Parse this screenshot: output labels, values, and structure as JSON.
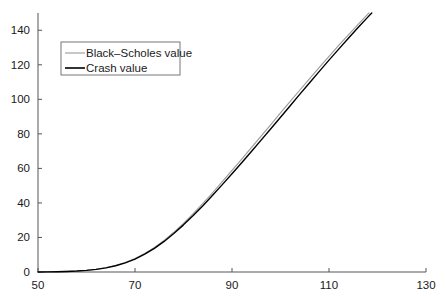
{
  "chart_data": {
    "type": "line",
    "title": "",
    "subtitle": "",
    "xlabel": "",
    "ylabel": "",
    "xlim": [
      50,
      130
    ],
    "ylim": [
      0,
      150
    ],
    "xticks": [
      50,
      70,
      90,
      110,
      130
    ],
    "yticks": [
      0,
      20,
      40,
      60,
      80,
      100,
      120,
      140
    ],
    "xtick_labels": [
      "50",
      "70",
      "90",
      "110",
      "130"
    ],
    "ytick_labels": [
      "0",
      "20",
      "40",
      "60",
      "80",
      "100",
      "120",
      "140"
    ],
    "grid": false,
    "legend_position": "upper left",
    "annotations": [],
    "series": [
      {
        "name": "Black-Scholes value",
        "color": "#9a9a9a",
        "linewidth": 1.1,
        "x": [
          50,
          52,
          54,
          56,
          58,
          60,
          62,
          64,
          66,
          68,
          70,
          72,
          74,
          76,
          78,
          80,
          82,
          84,
          86,
          88,
          90,
          92,
          94,
          96,
          98,
          100,
          102,
          104,
          106,
          108,
          110,
          112,
          114,
          116,
          118,
          120,
          122,
          124,
          126,
          128,
          130
        ],
        "y": [
          0.05,
          0.1,
          0.2,
          0.35,
          0.6,
          1.0,
          1.6,
          2.5,
          3.8,
          5.5,
          7.8,
          10.7,
          14.2,
          18.3,
          23.0,
          28.2,
          33.8,
          39.7,
          45.9,
          52.3,
          58.8,
          65.4,
          72.0,
          78.7,
          85.4,
          92.1,
          98.8,
          105.4,
          112.0,
          118.5,
          124.9,
          131.2,
          137.4,
          143.4,
          149.3,
          155.0,
          160.6,
          166.0,
          171.3,
          176.5,
          181.5
        ]
      },
      {
        "name": "Crash value",
        "color": "#000000",
        "linewidth": 1.4,
        "x": [
          50,
          52,
          54,
          56,
          58,
          60,
          62,
          64,
          66,
          68,
          70,
          72,
          74,
          76,
          78,
          80,
          82,
          84,
          86,
          88,
          90,
          92,
          94,
          96,
          98,
          100,
          102,
          104,
          106,
          108,
          110,
          112,
          114,
          116,
          118,
          120,
          122,
          124,
          126,
          128,
          130
        ],
        "y": [
          0.04,
          0.09,
          0.18,
          0.32,
          0.55,
          0.95,
          1.5,
          2.4,
          3.6,
          5.3,
          7.5,
          10.3,
          13.7,
          17.7,
          22.3,
          27.3,
          32.7,
          38.4,
          44.4,
          50.6,
          56.9,
          63.3,
          69.8,
          76.4,
          83.0,
          89.6,
          96.3,
          103.0,
          109.6,
          116.2,
          122.7,
          129.1,
          135.4,
          141.6,
          147.6,
          153.5,
          159.2,
          164.8,
          170.2,
          175.5,
          180.6
        ]
      }
    ]
  },
  "axes": {
    "spine_color": "#555555",
    "tick_color": "#555555",
    "background": "#ffffff"
  },
  "legend": {
    "border_color": "#777777",
    "background": "#ffffff",
    "entries": [
      {
        "label": "Black–Scholes value",
        "color": "#9a9a9a"
      },
      {
        "label": "Crash value",
        "color": "#000000"
      }
    ]
  }
}
